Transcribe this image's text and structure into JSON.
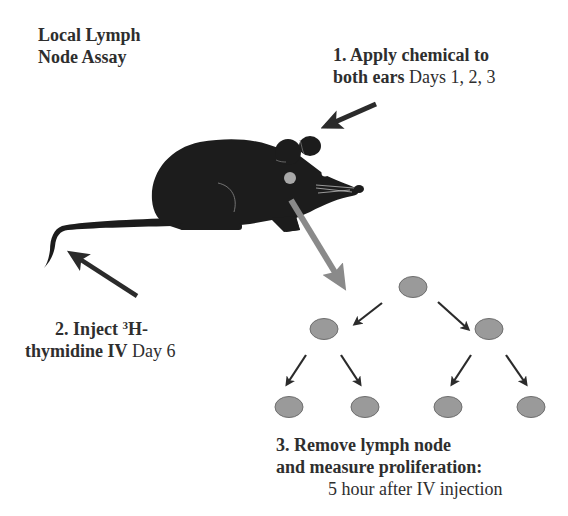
{
  "title": {
    "line1": "Local Lymph",
    "line2": "Node Assay"
  },
  "steps": [
    {
      "number": "1.",
      "bold_line1": "Apply chemical to",
      "bold_line2": "both ears",
      "normal": "Days 1, 2, 3"
    },
    {
      "number": "2.",
      "bold_prefix": "Inject ",
      "superscript": "3",
      "bold_line1_suffix": "H-",
      "bold_line2": "thymidine IV",
      "normal": "Day 6"
    },
    {
      "number": "3.",
      "bold_line1": "Remove lymph node",
      "bold_line2": "and measure proliferation:",
      "normal": "5 hour after IV injection"
    }
  ],
  "colors": {
    "text": "#2e2e2e",
    "mouse": "#1c1c1c",
    "arrow_dark": "#2b2b2b",
    "arrow_gray": "#8a8a8a",
    "cell_fill": "#9a9a9a",
    "cell_stroke": "#6e6e6e",
    "lymph_node": "#a8a8a8"
  },
  "diagram": {
    "cells": [
      {
        "level": 0,
        "cx": 413,
        "cy": 287
      },
      {
        "level": 1,
        "cx": 324,
        "cy": 329
      },
      {
        "level": 1,
        "cx": 489,
        "cy": 329
      },
      {
        "level": 2,
        "cx": 289,
        "cy": 407
      },
      {
        "level": 2,
        "cx": 365,
        "cy": 407
      },
      {
        "level": 2,
        "cx": 448,
        "cy": 407
      },
      {
        "level": 2,
        "cx": 531,
        "cy": 407
      }
    ]
  }
}
